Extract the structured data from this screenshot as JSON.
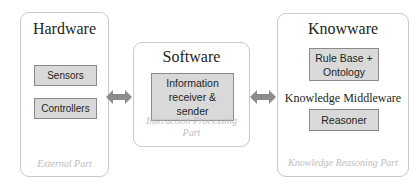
{
  "diagram": {
    "colors": {
      "panel_border": "#c9c9c9",
      "panel_background": "#ffffff",
      "component_fill": "#d9d9d9",
      "component_border": "#8a8a8a",
      "caption_text": "#bdbdbd",
      "body_text": "#231f20",
      "arrow_fill": "#8c8c8c"
    },
    "panels": [
      {
        "id": "hardware",
        "title": "Hardware",
        "caption": "External Part",
        "components": [
          {
            "id": "sensors",
            "label": "Sensors"
          },
          {
            "id": "controllers",
            "label": "Controllers"
          }
        ]
      },
      {
        "id": "software",
        "title": "Software",
        "caption": "Interaction Processing Part",
        "components": [
          {
            "id": "information-receiver-sender",
            "label": "Information receiver & sender"
          }
        ]
      },
      {
        "id": "knowware",
        "title": "Knowware",
        "caption": "Knowledge Reasoning Part",
        "middle_label": "Knowledge Middleware",
        "components": [
          {
            "id": "rule-base-ontology",
            "label": "Rule Base + Ontology"
          },
          {
            "id": "reasoner",
            "label": "Reasoner"
          }
        ]
      }
    ],
    "connectors": [
      {
        "id": "hardware-software",
        "type": "double-arrow-icon"
      },
      {
        "id": "software-knowware",
        "type": "double-arrow-icon"
      }
    ]
  }
}
